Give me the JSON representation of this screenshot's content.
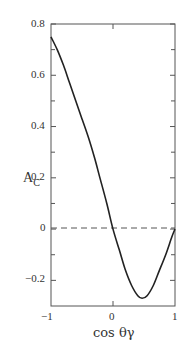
{
  "chart_data": {
    "type": "line",
    "title": "",
    "xlabel": "cos θγ",
    "ylabel": "A_C",
    "xlim": [
      -1,
      1
    ],
    "ylim": [
      -0.3,
      0.8
    ],
    "xticks": [
      "-1",
      "0",
      "1"
    ],
    "yticks": [
      "-0.2",
      "0",
      "0.2",
      "0.4",
      "0.6",
      "0.8"
    ],
    "grid": false,
    "series": [
      {
        "name": "A_C",
        "style": "solid",
        "x": [
          -1.0,
          -0.9,
          -0.8,
          -0.7,
          -0.6,
          -0.5,
          -0.4,
          -0.3,
          -0.2,
          -0.1,
          0.0,
          0.1,
          0.2,
          0.3,
          0.4,
          0.47,
          0.55,
          0.65,
          0.75,
          0.85,
          0.95,
          1.0
        ],
        "y": [
          0.75,
          0.7,
          0.64,
          0.57,
          0.5,
          0.43,
          0.36,
          0.28,
          0.19,
          0.1,
          0.0,
          -0.08,
          -0.16,
          -0.22,
          -0.26,
          -0.27,
          -0.26,
          -0.22,
          -0.16,
          -0.1,
          -0.03,
          0.0
        ]
      },
      {
        "name": "zero",
        "style": "dashed",
        "x": [
          -1,
          1
        ],
        "y": [
          0,
          0
        ]
      }
    ]
  },
  "labels": {
    "ylabel_main": "A",
    "ylabel_sub": "C",
    "xlabel": "cos θγ",
    "yticks": [
      "0.8",
      "0.6",
      "0.4",
      "0.2",
      "0",
      "−0.2"
    ],
    "xticks": [
      "−1",
      "0",
      "1"
    ]
  }
}
